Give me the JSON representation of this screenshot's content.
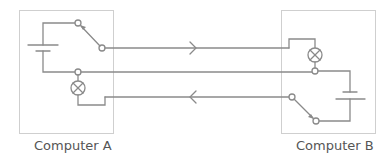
{
  "diagram": {
    "colors": {
      "wire": "#8a8a8a",
      "box_border": "#cfcfcf",
      "label_text": "#555555"
    },
    "computers": [
      {
        "id": "A",
        "label": "Computer A",
        "components": [
          "battery",
          "switch",
          "lamp"
        ]
      },
      {
        "id": "B",
        "label": "Computer B",
        "components": [
          "battery",
          "switch",
          "lamp"
        ]
      }
    ],
    "connections": [
      {
        "from": "A switch",
        "to": "B lamp",
        "direction": "right"
      },
      {
        "from": "A junction",
        "to": "B junction",
        "direction": "none"
      },
      {
        "from": "B switch",
        "to": "A lamp",
        "direction": "left"
      }
    ]
  }
}
